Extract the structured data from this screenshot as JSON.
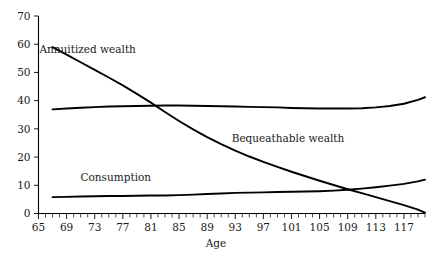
{
  "chart_data": {
    "type": "line",
    "title": "",
    "subtitle": "",
    "xlabel": "Age",
    "ylabel": "",
    "xlim": [
      65,
      120
    ],
    "ylim": [
      0,
      70
    ],
    "grid": false,
    "legend_position": "inline-annotations",
    "x_ticks_major": [
      65,
      69,
      73,
      77,
      81,
      85,
      89,
      93,
      97,
      101,
      105,
      109,
      113,
      117
    ],
    "x_tick_step_minor": 1,
    "y_ticks": [
      0,
      10,
      20,
      30,
      40,
      50,
      60,
      70
    ],
    "x": [
      67,
      69,
      71,
      73,
      75,
      77,
      79,
      81,
      83,
      85,
      87,
      89,
      91,
      93,
      95,
      97,
      99,
      101,
      103,
      105,
      107,
      109,
      111,
      113,
      115,
      117,
      119,
      120
    ],
    "series": [
      {
        "name": "Annuitized wealth",
        "label": "Annuitized wealth",
        "label_x": 72,
        "label_y": 57,
        "color": "#000000",
        "values": [
          59.0,
          56.3,
          53.6,
          50.9,
          48.2,
          45.4,
          42.4,
          39.3,
          36.0,
          32.8,
          29.8,
          27.1,
          24.6,
          22.3,
          20.2,
          18.3,
          16.5,
          14.8,
          13.2,
          11.6,
          10.1,
          8.6,
          7.2,
          5.8,
          4.4,
          3.0,
          1.4,
          0.3
        ]
      },
      {
        "name": "Bequeathable wealth",
        "label": "Bequeathable wealth",
        "label_x": 100.5,
        "label_y": 25.5,
        "color": "#000000",
        "values": [
          36.9,
          37.2,
          37.5,
          37.7,
          37.9,
          38.0,
          38.1,
          38.2,
          38.3,
          38.3,
          38.2,
          38.1,
          38.0,
          37.9,
          37.8,
          37.7,
          37.6,
          37.4,
          37.3,
          37.2,
          37.2,
          37.2,
          37.3,
          37.6,
          38.1,
          38.9,
          40.3,
          41.2
        ]
      },
      {
        "name": "Consumption",
        "label": "Consumption",
        "label_x": 76,
        "label_y": 11.5,
        "color": "#000000",
        "values": [
          5.8,
          5.9,
          6.0,
          6.1,
          6.2,
          6.2,
          6.3,
          6.4,
          6.4,
          6.5,
          6.7,
          6.9,
          7.1,
          7.3,
          7.4,
          7.5,
          7.6,
          7.7,
          7.8,
          7.9,
          8.1,
          8.4,
          8.8,
          9.3,
          9.9,
          10.5,
          11.4,
          12.0
        ]
      }
    ]
  },
  "figure": {
    "background": "#ffffff",
    "axis_color": "#000000",
    "text_color": "#1a1a1a"
  }
}
